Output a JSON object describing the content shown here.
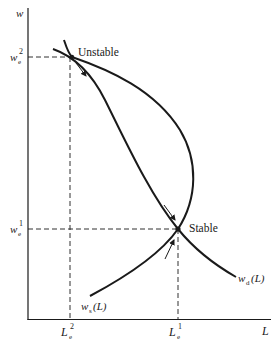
{
  "diagram": {
    "type": "labor-market-equilibria",
    "axes": {
      "y_label": "w",
      "x_label": "L"
    },
    "y_ticks": [
      {
        "base": "w",
        "sub": "e",
        "sup": "2"
      },
      {
        "base": "w",
        "sub": "e",
        "sup": "1"
      }
    ],
    "x_ticks": [
      {
        "base": "L",
        "sub": "e",
        "sup": "2"
      },
      {
        "base": "L",
        "sub": "e",
        "sup": "1"
      }
    ],
    "equilibria": [
      {
        "label": "Unstable"
      },
      {
        "label": "Stable"
      }
    ],
    "curves": [
      {
        "name": "demand",
        "label_base": "w",
        "label_sub": "d",
        "label_arg": "(L)"
      },
      {
        "name": "supply",
        "label_base": "w",
        "label_sub": "s",
        "label_arg": "(L)"
      }
    ],
    "colors": {
      "ink": "#1a1a1a",
      "background": "#ffffff"
    }
  }
}
